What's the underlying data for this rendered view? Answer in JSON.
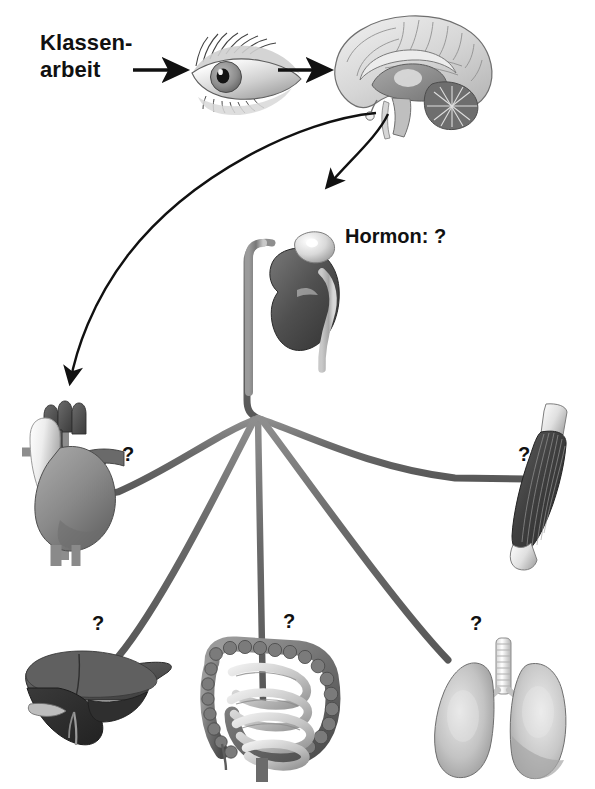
{
  "diagram": {
    "title_text": "Klassen-\narbeit",
    "hormone_label": "Hormon: ?",
    "question_marks": {
      "heart": "?",
      "muscle": "?",
      "liver": "?",
      "gut": "?",
      "lung": "?"
    },
    "organs": [
      {
        "id": "eye",
        "icon": "eye-icon"
      },
      {
        "id": "brain",
        "icon": "brain-sagittal-icon"
      },
      {
        "id": "kidney",
        "icon": "kidney-adrenal-icon"
      },
      {
        "id": "heart",
        "icon": "heart-icon"
      },
      {
        "id": "muscle",
        "icon": "skeletal-muscle-icon"
      },
      {
        "id": "liver",
        "icon": "liver-icon"
      },
      {
        "id": "gut",
        "icon": "intestines-icon"
      },
      {
        "id": "lung",
        "icon": "lungs-icon"
      }
    ],
    "connectors": [
      {
        "id": "arrow-stimulus-to-eye",
        "icon": "straight-arrow-icon"
      },
      {
        "id": "arrow-eye-to-brain",
        "icon": "straight-arrow-icon"
      },
      {
        "id": "arrow-brain-to-heart",
        "icon": "curved-arrow-icon"
      },
      {
        "id": "arrow-brain-to-kidney",
        "icon": "curved-arrow-icon"
      },
      {
        "id": "nerve-trunk",
        "icon": "nerve-line-icon"
      },
      {
        "id": "nerve-to-heart",
        "icon": "nerve-line-icon"
      },
      {
        "id": "nerve-to-muscle",
        "icon": "nerve-line-icon"
      },
      {
        "id": "nerve-to-liver",
        "icon": "nerve-line-icon"
      },
      {
        "id": "nerve-to-gut",
        "icon": "nerve-line-icon"
      },
      {
        "id": "nerve-to-lung",
        "icon": "nerve-line-icon"
      }
    ],
    "colors": {
      "background": "#ffffff",
      "ink": "#111111",
      "nerve": "#6d6d6d",
      "organ_dark": "#3a3a3a",
      "organ_mid": "#8a8a8a",
      "organ_light": "#d4d4d4"
    }
  }
}
